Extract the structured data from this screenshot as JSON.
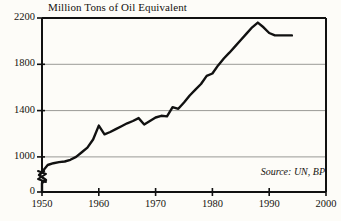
{
  "chart_data": {
    "type": "line",
    "title": "Million Tons of Oil Equivalent",
    "xlabel": "",
    "ylabel": "Million Tons of Oil Equivalent",
    "xlim": [
      1950,
      2000
    ],
    "ylim": [
      0,
      2200
    ],
    "y_axis_break": true,
    "y_break_note": "axis broken between 0 and ~800",
    "grid": true,
    "grid_values": [
      1000,
      1400,
      1800
    ],
    "legend": "none",
    "source_note": "Source: UN, BP",
    "ytick_labels": [
      "2200",
      "1800",
      "1400",
      "1000",
      "0"
    ],
    "ytick_values": [
      2200,
      1800,
      1400,
      1000,
      0
    ],
    "xtick_labels": [
      "1950",
      "1960",
      "1970",
      "1980",
      "1990",
      "2000"
    ],
    "xtick_values": [
      1950,
      1960,
      1970,
      1980,
      1990,
      2000
    ],
    "series": [
      {
        "name": "World energy consumption",
        "color": "#111111",
        "x": [
          1950,
          1951,
          1952,
          1953,
          1954,
          1955,
          1956,
          1957,
          1958,
          1959,
          1960,
          1961,
          1962,
          1963,
          1964,
          1965,
          1966,
          1967,
          1968,
          1969,
          1970,
          1971,
          1972,
          1973,
          1974,
          1975,
          1976,
          1977,
          1978,
          1979,
          1980,
          1981,
          1982,
          1983,
          1984,
          1985,
          1986,
          1987,
          1988,
          1989,
          1990,
          1991,
          1992,
          1993,
          1994
        ],
        "values": [
          870,
          930,
          945,
          955,
          960,
          975,
          1000,
          1040,
          1080,
          1150,
          1270,
          1195,
          1215,
          1240,
          1265,
          1290,
          1310,
          1335,
          1280,
          1310,
          1340,
          1355,
          1350,
          1430,
          1415,
          1470,
          1530,
          1580,
          1630,
          1700,
          1720,
          1790,
          1850,
          1900,
          1955,
          2010,
          2065,
          2120,
          2160,
          2120,
          2070,
          2050,
          2050,
          2050,
          2050
        ]
      }
    ]
  },
  "axes": {
    "title": "Million Tons of Oil Equivalent",
    "source": "Source: UN, BP"
  }
}
